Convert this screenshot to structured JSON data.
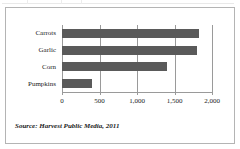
{
  "figure": {
    "source_note": "Source: Harvest Public Media, 2011",
    "border_color": "#b4b4b4",
    "background": "#ffffff"
  },
  "chart_data": {
    "type": "bar",
    "orientation": "horizontal",
    "title": "",
    "xlabel": "",
    "ylabel": "",
    "categories": [
      "Carrots",
      "Garlic",
      "Corn",
      "Pumpkins"
    ],
    "values": [
      1830,
      1800,
      1400,
      400
    ],
    "xlim": [
      0,
      2000
    ],
    "xticks": [
      0,
      500,
      1000,
      1500,
      2000
    ],
    "xtick_labels": [
      "0",
      "500",
      "1,000",
      "1,500",
      "2,000"
    ],
    "grid": true,
    "grid_axis": "x",
    "legend": false,
    "bar_color": "#5a5a5a",
    "axis_color": "#9a9a9a"
  }
}
